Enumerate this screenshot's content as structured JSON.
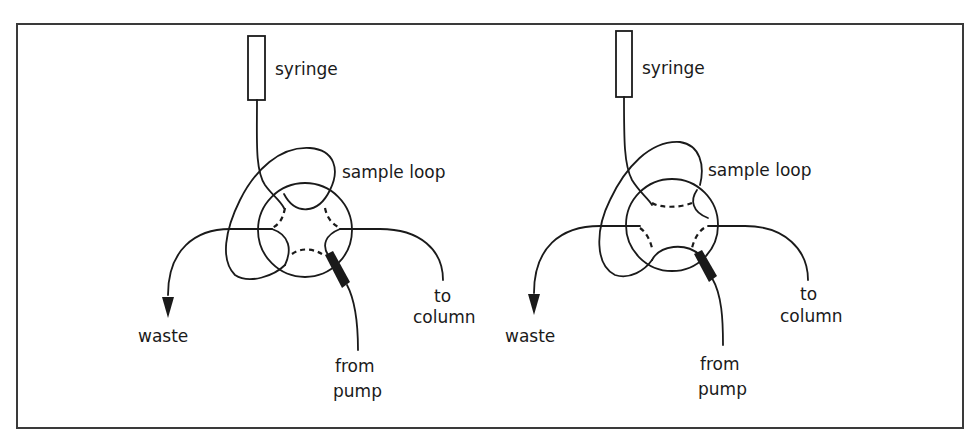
{
  "figure": {
    "frame_color": "#3a3a3a",
    "ink_color": "#1a1a1a",
    "background": "#ffffff"
  },
  "panels": [
    {
      "id": "load-position",
      "labels": {
        "syringe": "syringe",
        "sample_loop": "sample loop",
        "waste": "waste",
        "to_column_line1": "to",
        "to_column_line2": "column",
        "from_pump_line1": "from",
        "from_pump_line2": "pump"
      },
      "components": [
        "syringe",
        "sample-loop",
        "six-port-valve",
        "waste-outlet",
        "column-outlet",
        "pump-inlet"
      ]
    },
    {
      "id": "inject-position",
      "labels": {
        "syringe": "syringe",
        "sample_loop": "sample loop",
        "waste": "waste",
        "to_column_line1": "to",
        "to_column_line2": "column",
        "from_pump_line1": "from",
        "from_pump_line2": "pump"
      },
      "components": [
        "syringe",
        "sample-loop",
        "six-port-valve",
        "waste-outlet",
        "column-outlet",
        "pump-inlet"
      ]
    }
  ]
}
